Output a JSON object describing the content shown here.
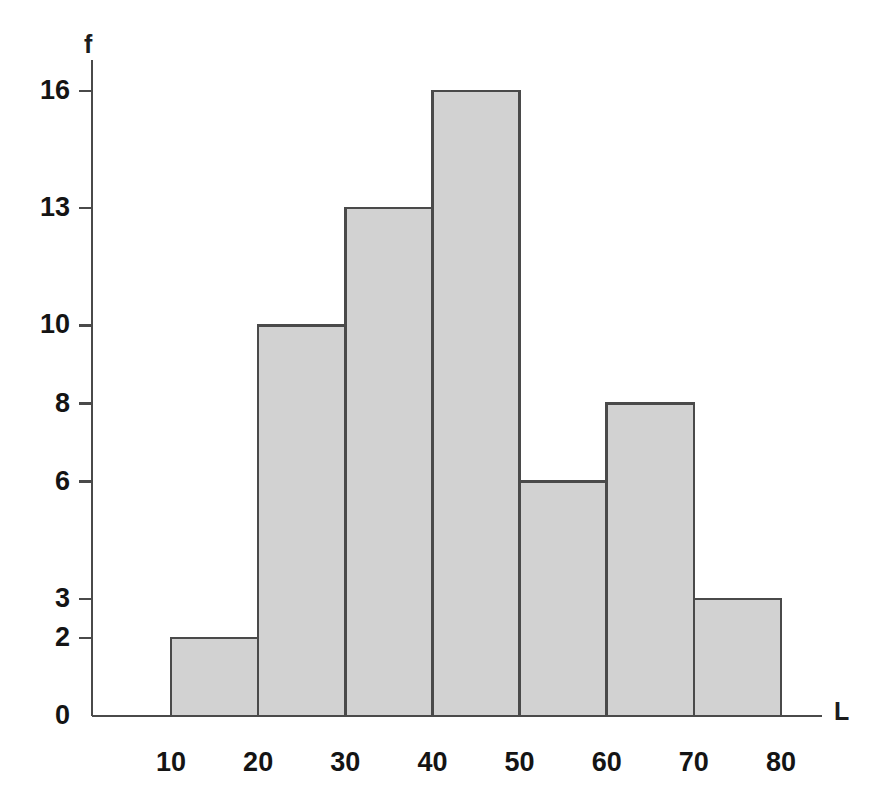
{
  "chart_data": {
    "type": "bar",
    "title": "",
    "subtitle": "",
    "xlabel": "L",
    "ylabel": "f",
    "bin_edges": [
      10,
      20,
      30,
      40,
      50,
      60,
      70,
      80
    ],
    "categories": [
      "10-20",
      "20-30",
      "30-40",
      "40-50",
      "50-60",
      "60-70",
      "70-80"
    ],
    "values": [
      2,
      10,
      13,
      16,
      6,
      8,
      3
    ],
    "bars": [
      {
        "label": "10-20",
        "start": 10,
        "end": 20,
        "value": 2
      },
      {
        "label": "20-30",
        "start": 20,
        "end": 30,
        "value": 10
      },
      {
        "label": "30-40",
        "start": 30,
        "end": 40,
        "value": 13
      },
      {
        "label": "40-50",
        "start": 40,
        "end": 50,
        "value": 16
      },
      {
        "label": "50-60",
        "start": 50,
        "end": 60,
        "value": 6
      },
      {
        "label": "60-70",
        "start": 60,
        "end": 70,
        "value": 8
      },
      {
        "label": "70-80",
        "start": 70,
        "end": 80,
        "value": 3
      }
    ],
    "xticks": [
      10,
      20,
      30,
      40,
      50,
      60,
      70,
      80
    ],
    "xtick_labels": [
      "10",
      "20",
      "30",
      "40",
      "50",
      "60",
      "70",
      "80"
    ],
    "yticks": [
      0,
      2,
      3,
      6,
      8,
      10,
      13,
      16
    ],
    "ytick_labels": [
      "0",
      "2",
      "3",
      "6",
      "8",
      "10",
      "13",
      "16"
    ],
    "xlim": [
      4,
      84
    ],
    "ylim": [
      0,
      16.6
    ],
    "grid": false,
    "legend": null,
    "bar_fill_color": "#d2d2d2",
    "bar_edge_color": "#4a4a4a",
    "axis_color": "#4a4a4a",
    "background_color": "#ffffff"
  }
}
